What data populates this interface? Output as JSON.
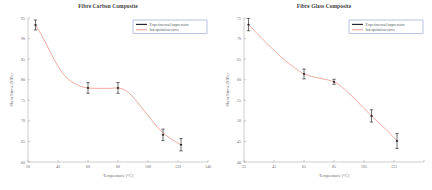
{
  "figure": {
    "background": "#ffffff",
    "curve_color": "#e8907f",
    "marker_color": "#1a1a1a",
    "legend_border_color": "#5566bb",
    "axis_color": "#9a9a9a"
  },
  "panels": [
    {
      "id": "carbon",
      "legend": {
        "items": [
          {
            "label": "Experimental impression",
            "icon": "line-swatch-black",
            "color": "#23262b"
          },
          {
            "label": "Interpolation curve",
            "icon": "line-swatch-salmon",
            "color": "#e8907f"
          }
        ]
      },
      "chart_data": {
        "type": "scatter",
        "title": "Fibre Carbon Composite",
        "xlabel": "Temperature (°C)",
        "ylabel": "Shear Stress (MPa)",
        "xlim": [
          20,
          140
        ],
        "ylim": [
          60,
          95
        ],
        "xticks": [
          20,
          40,
          60,
          80,
          100,
          120,
          140
        ],
        "xticklabels": [
          "20",
          "40",
          "60",
          "80",
          "100",
          "120",
          "140"
        ],
        "yticks": [
          60,
          65,
          70,
          75,
          80,
          85,
          90,
          95
        ],
        "yticklabels": [
          "60",
          "65",
          "70",
          "75",
          "80",
          "85",
          "90",
          "95"
        ],
        "grid": false,
        "legend_position": "upper right",
        "series": [
          {
            "name": "Experimental impression",
            "x": [
              25,
              60,
              80,
              110,
              122
            ],
            "y": [
              93.3,
              78.0,
              78.0,
              66.6,
              64.2
            ],
            "yerr": [
              1.2,
              1.3,
              1.3,
              1.4,
              1.5
            ]
          },
          {
            "name": "Interpolation curve",
            "x": [
              25,
              30,
              35,
              40,
              45,
              50,
              55,
              60,
              65,
              70,
              75,
              80,
              85,
              90,
              95,
              100,
              105,
              110,
              115,
              120,
              122
            ],
            "y": [
              93.3,
              90.2,
              86.6,
              83.3,
              80.8,
              79.3,
              78.4,
              78.0,
              77.9,
              77.9,
              77.9,
              78.0,
              77.4,
              75.8,
              73.6,
              71.3,
              69.0,
              67.1,
              65.7,
              64.6,
              64.2
            ]
          }
        ]
      }
    },
    {
      "id": "glass",
      "legend": {
        "items": [
          {
            "label": "Experimental impression",
            "icon": "line-swatch-black",
            "color": "#23262b"
          },
          {
            "label": "Interpolation curve",
            "icon": "line-swatch-salmon",
            "color": "#e8907f"
          }
        ]
      },
      "chart_data": {
        "type": "scatter",
        "title": "Fibre Glass Composite",
        "xlabel": "Temperature (°C)",
        "ylabel": "Shear Stress (MPa)",
        "xlim": [
          25,
          145
        ],
        "ylim": [
          40,
          75
        ],
        "xticks": [
          25,
          45,
          65,
          85,
          105,
          125,
          145
        ],
        "xticklabels": [
          "25",
          "45",
          "65",
          "85",
          "105",
          "125",
          ""
        ],
        "yticks": [
          40,
          45,
          50,
          55,
          60,
          65,
          70,
          75
        ],
        "yticklabels": [
          "40",
          "45",
          "50",
          "55",
          "60",
          "65",
          "70",
          "75"
        ],
        "grid": false,
        "legend_position": "upper right",
        "series": [
          {
            "name": "Experimental impression",
            "x": [
              28,
              65,
              85,
              110,
              127
            ],
            "y": [
              73.4,
              61.4,
              59.5,
              51.2,
              45.1
            ],
            "yerr": [
              1.5,
              1.2,
              0.6,
              1.5,
              1.8
            ]
          },
          {
            "name": "Interpolation curve",
            "x": [
              28,
              33,
              38,
              43,
              48,
              53,
              58,
              63,
              65,
              70,
              75,
              80,
              85,
              90,
              95,
              100,
              105,
              110,
              115,
              120,
              125,
              127
            ],
            "y": [
              73.4,
              71.5,
              69.6,
              67.8,
              66.1,
              64.5,
              63.1,
              61.8,
              61.4,
              60.8,
              60.4,
              60.0,
              59.5,
              58.3,
              56.7,
              54.9,
              53.0,
              51.2,
              49.5,
              47.8,
              45.9,
              45.1
            ]
          }
        ]
      }
    }
  ]
}
